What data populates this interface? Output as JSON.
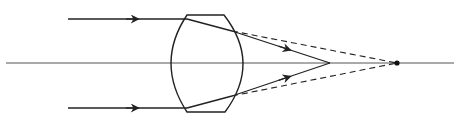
{
  "diagram": {
    "title": "",
    "colors": {
      "background": "#ffffff",
      "stroke": "#222222",
      "axis": "#555555"
    },
    "optical_axis": {
      "x1": 6,
      "x2": 454,
      "y": 63
    },
    "lens": {
      "type": "thick-biconvex",
      "top_edge": {
        "x1": 187,
        "x2": 224,
        "y": 15
      },
      "bottom_edge": {
        "x1": 187,
        "x2": 225,
        "y": 112
      },
      "left_apex_x": 171,
      "right_apex_x": 243
    },
    "rays": [
      {
        "name": "upper-ray",
        "incoming": {
          "x1": 68,
          "y1": 19,
          "x2": 187,
          "y2": 19
        },
        "incoming_arrow": {
          "x": 138,
          "y": 19
        },
        "inside": {
          "x1": 187,
          "y1": 19,
          "x2": 232,
          "y2": 31
        },
        "outgoing": {
          "x1": 232,
          "y1": 31,
          "x2": 330,
          "y2": 63
        },
        "outgoing_arrow": {
          "x": 290,
          "y": 50
        },
        "dashed": {
          "x1": 232,
          "y1": 31,
          "x2": 397,
          "y2": 63
        }
      },
      {
        "name": "lower-ray",
        "incoming": {
          "x1": 68,
          "y1": 108,
          "x2": 187,
          "y2": 108
        },
        "incoming_arrow": {
          "x": 138,
          "y": 108
        },
        "inside": {
          "x1": 187,
          "y1": 108,
          "x2": 232,
          "y2": 96
        },
        "outgoing": {
          "x1": 232,
          "y1": 96,
          "x2": 330,
          "y2": 63
        },
        "outgoing_arrow": {
          "x": 290,
          "y": 77
        },
        "dashed": {
          "x1": 232,
          "y1": 96,
          "x2": 397,
          "y2": 63
        }
      }
    ],
    "focal_point_solid": {
      "x": 330,
      "y": 63
    },
    "focal_point_dashed": {
      "x": 397,
      "y": 63,
      "marker": "dot"
    }
  }
}
